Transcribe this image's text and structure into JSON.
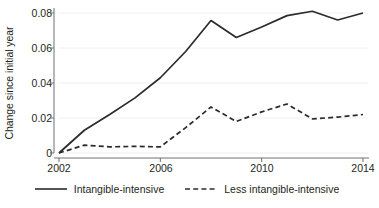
{
  "chart_data": {
    "type": "line",
    "title": "",
    "subtitle": "",
    "xlabel": "",
    "ylabel": "Change since initial year",
    "x": [
      2002,
      2003,
      2004,
      2005,
      2006,
      2007,
      2008,
      2009,
      2010,
      2011,
      2012,
      2013,
      2014
    ],
    "xlim": [
      2002,
      2014
    ],
    "ylim": [
      0,
      0.085
    ],
    "yticks": [
      0,
      0.02,
      0.04,
      0.06,
      0.08
    ],
    "ytick_labels": [
      "0",
      "0.02",
      "0.04",
      "0.06",
      "0.08"
    ],
    "xticks": [
      2002,
      2006,
      2010,
      2014
    ],
    "xtick_labels": [
      "2002",
      "2006",
      "2010",
      "2014"
    ],
    "grid": "horizontal",
    "legend_position": "bottom",
    "series": [
      {
        "name": "Intangible-intensive",
        "style": "solid",
        "color": "#2b2b2b",
        "values": [
          0.0,
          0.013,
          0.022,
          0.0315,
          0.043,
          0.058,
          0.0757,
          0.066,
          0.072,
          0.0785,
          0.081,
          0.076,
          0.08
        ]
      },
      {
        "name": "Less intangible-intensive",
        "style": "dashed",
        "color": "#2b2b2b",
        "values": [
          0.0,
          0.0045,
          0.0035,
          0.0038,
          0.0035,
          0.0145,
          0.0263,
          0.018,
          0.0235,
          0.028,
          0.0195,
          0.0205,
          0.022
        ]
      }
    ]
  },
  "axis": {
    "y_title": "Change since initial year",
    "y_tick_labels": [
      "0.08",
      "0.06",
      "0.04",
      "0.02",
      "0"
    ],
    "x_tick_labels": [
      "2002",
      "2006",
      "2010",
      "2014"
    ]
  },
  "legend": {
    "items": [
      {
        "label": "Intangible-intensive",
        "marker": "solid-line-swatch"
      },
      {
        "label": "Less intangible-intensive",
        "marker": "dashed-line-swatch"
      }
    ]
  },
  "colors": {
    "line": "#2b2b2b",
    "axis": "#6f7072",
    "grid": "#f0f0f0",
    "text": "#231f20",
    "background": "#ffffff"
  }
}
